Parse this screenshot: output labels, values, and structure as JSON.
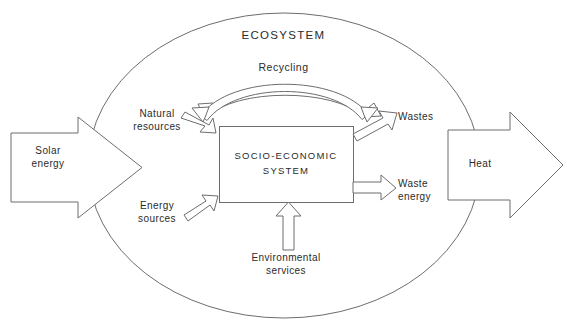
{
  "diagram": {
    "title": "ECOSYSTEM",
    "center_box": {
      "line1": "SOCIO-ECONOMIC",
      "line2": "SYSTEM"
    },
    "labels": {
      "recycling": "Recycling",
      "solar_energy": "Solar\nenergy",
      "heat": "Heat",
      "natural_resources": "Natural\nresources",
      "energy_sources": "Energy\nsources",
      "wastes": "Wastes",
      "waste_energy": "Waste\nenergy",
      "environmental_services": "Environmental\nservices"
    },
    "colors": {
      "stroke": "#6d6d6d",
      "text": "#2b2b2b",
      "background": "#ffffff"
    },
    "elements": {
      "boundary": "ecosystem-ellipse",
      "input_arrow": "solar-energy-arrow",
      "output_arrow": "heat-arrow",
      "recycling_arc": "recycling-double-arrow"
    }
  }
}
